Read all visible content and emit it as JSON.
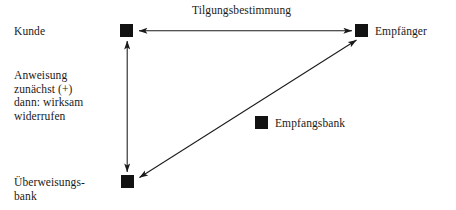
{
  "diagram": {
    "title": "Tilgungsbestimmung",
    "nodes": [
      {
        "id": "kunde",
        "label": "Kunde",
        "x": 120,
        "y": 24
      },
      {
        "id": "empfaenger",
        "label": "Empfänger",
        "x": 355,
        "y": 24
      },
      {
        "id": "empfangsbank",
        "label": "Empfangsbank",
        "x": 255,
        "y": 116
      },
      {
        "id": "ueberweisungsbank",
        "label": "Überweisungs-\nbank",
        "x": 121,
        "y": 175
      }
    ],
    "edges": [
      {
        "id": "edge-kunde-empfaenger",
        "from": "kunde",
        "to": "empfaenger",
        "label": "Tilgungsbestimmung",
        "arrow": "double",
        "orientation": "horizontal"
      },
      {
        "id": "edge-kunde-ueberweisungsbank",
        "from": "kunde",
        "to": "ueberweisungsbank",
        "label": "Anweisung\nzunächst (+)\ndann: wirksam\nwiderrufen",
        "arrow": "double",
        "orientation": "vertical"
      },
      {
        "id": "edge-ueberweisungsbank-empfaenger",
        "from": "ueberweisungsbank",
        "to": "empfaenger",
        "label": "",
        "arrow": "double",
        "orientation": "diagonal"
      }
    ],
    "annotations": {
      "left_note": "Anweisung\nzunächst (+)\ndann: wirksam\nwiderrufen"
    },
    "colors": {
      "node_fill": "#121212",
      "line": "#1a1a1a",
      "text": "#1a1a1a",
      "background": "#ffffff"
    }
  }
}
